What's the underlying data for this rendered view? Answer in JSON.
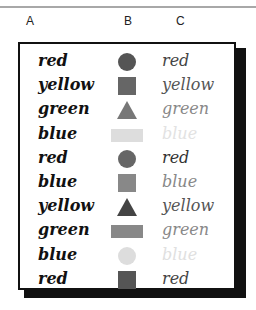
{
  "columns": [
    "A",
    "B",
    "C"
  ],
  "rows": [
    {
      "word_a": "red",
      "shape": "circle",
      "shape_color": "#555555",
      "word_c": "red",
      "word_c_color": "#444444"
    },
    {
      "word_a": "yellow",
      "shape": "square",
      "shape_color": "#666666",
      "word_c": "yellow",
      "word_c_color": "#555555"
    },
    {
      "word_a": "green",
      "shape": "triangle",
      "shape_color": "#777777",
      "word_c": "green",
      "word_c_color": "#888888"
    },
    {
      "word_a": "blue",
      "shape": "rectangle",
      "shape_color": "#dddddd",
      "word_c": "blue",
      "word_c_color": "#e2e2e2"
    },
    {
      "word_a": "red",
      "shape": "circle",
      "shape_color": "#666666",
      "word_c": "red",
      "word_c_color": "#333333"
    },
    {
      "word_a": "blue",
      "shape": "square",
      "shape_color": "#888888",
      "word_c": "blue",
      "word_c_color": "#888888"
    },
    {
      "word_a": "yellow",
      "shape": "triangle",
      "shape_color": "#444444",
      "word_c": "yellow",
      "word_c_color": "#555555"
    },
    {
      "word_a": "green",
      "shape": "rectangle",
      "shape_color": "#888888",
      "word_c": "green",
      "word_c_color": "#888888"
    },
    {
      "word_a": "blue",
      "shape": "circle",
      "shape_color": "#dddddd",
      "word_c": "blue",
      "word_c_color": "#e0e0e0"
    },
    {
      "word_a": "red",
      "shape": "square",
      "shape_color": "#555555",
      "word_c": "red",
      "word_c_color": "#444444"
    }
  ]
}
